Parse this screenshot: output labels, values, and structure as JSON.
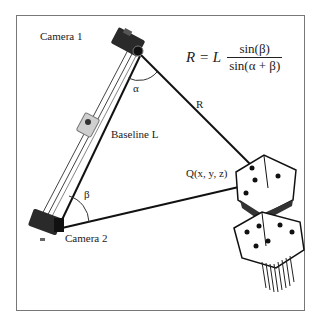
{
  "diagram": {
    "type": "stereo-triangulation",
    "labels": {
      "camera1": "Camera 1",
      "camera2": "Camera 2",
      "baseline": "Baseline L",
      "range": "R",
      "alpha": "α",
      "beta": "β",
      "target": "Q(x, y, z)"
    },
    "formula": {
      "lhs": "R = L",
      "numerator": "sin(β)",
      "denominator": "sin(α + β)"
    },
    "colors": {
      "line": "#111111",
      "frame": "#777777",
      "background": "#ffffff"
    }
  }
}
